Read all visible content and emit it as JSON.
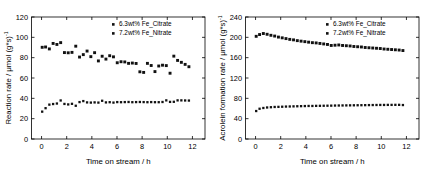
{
  "figure": {
    "background": "#ffffff",
    "axis_color": "#000000",
    "marker_color": "#111111"
  },
  "legend": {
    "position": "top-right",
    "entries": [
      {
        "marker": "square",
        "label": "6.3wt% Fe_Citrate"
      },
      {
        "marker": "square",
        "label": "7.2wt% Fe_Nitrate"
      }
    ]
  },
  "chart_data": [
    {
      "type": "scatter",
      "panel": "left",
      "title": "",
      "xlabel": "Time on stream / h",
      "ylabel_main": "Reaction rate / μmol (g*s)",
      "ylabel_sup": "-1",
      "xlim": [
        -0.8,
        13.0
      ],
      "ylim": [
        0,
        120
      ],
      "xticks": [
        0,
        2,
        4,
        6,
        8,
        10,
        12
      ],
      "yticks": [
        0,
        20,
        40,
        60,
        80,
        100,
        120
      ],
      "xtick_labels": [
        "0",
        "2",
        "4",
        "6",
        "8",
        "10",
        "12"
      ],
      "ytick_labels": [
        "0",
        "20",
        "40",
        "60",
        "80",
        "100",
        "120"
      ],
      "grid": false,
      "series": [
        {
          "name": "6.3wt% Fe_Citrate",
          "x": [
            0.05,
            0.32,
            0.62,
            0.92,
            1.22,
            1.52,
            1.82,
            2.12,
            2.42,
            2.72,
            3.02,
            3.32,
            3.62,
            3.92,
            4.22,
            4.52,
            4.82,
            5.12,
            5.42,
            5.72,
            6.02,
            6.32,
            6.62,
            6.92,
            7.22,
            7.52,
            7.82,
            8.12,
            8.42,
            8.72,
            9.02,
            9.32,
            9.62,
            9.92,
            10.22,
            10.52,
            10.82,
            11.12,
            11.42,
            11.72
          ],
          "y": [
            90.2,
            90.5,
            88.6,
            94.0,
            93.0,
            94.8,
            85.0,
            84.8,
            85.2,
            91.3,
            80.6,
            83.0,
            86.5,
            81.0,
            84.9,
            76.8,
            81.4,
            78.6,
            81.9,
            80.8,
            75.0,
            76.0,
            75.8,
            74.4,
            74.7,
            74.3,
            66.1,
            65.5,
            74.4,
            72.3,
            66.3,
            71.8,
            72.6,
            72.2,
            64.7,
            81.5,
            77.3,
            75.4,
            73.4,
            71.1
          ]
        },
        {
          "name": "7.2wt% Fe_Nitrate",
          "x": [
            0.05,
            0.32,
            0.62,
            0.92,
            1.22,
            1.52,
            1.82,
            2.12,
            2.42,
            2.72,
            3.02,
            3.32,
            3.62,
            3.92,
            4.22,
            4.52,
            4.82,
            5.12,
            5.42,
            5.72,
            6.02,
            6.32,
            6.62,
            6.92,
            7.22,
            7.52,
            7.82,
            8.12,
            8.42,
            8.72,
            9.02,
            9.32,
            9.62,
            9.92,
            10.22,
            10.52,
            10.82,
            11.12,
            11.42,
            11.72
          ],
          "y": [
            26.9,
            30.3,
            33.8,
            34.4,
            34.9,
            37.9,
            34.5,
            34.0,
            34.6,
            32.7,
            36.3,
            37.3,
            36.0,
            35.8,
            36.0,
            35.8,
            37.6,
            36.0,
            36.2,
            35.8,
            36.3,
            36.2,
            36.3,
            36.4,
            36.2,
            36.3,
            36.4,
            36.3,
            36.2,
            36.3,
            36.2,
            36.2,
            36.4,
            38.0,
            36.5,
            36.6,
            38.0,
            38.0,
            37.9,
            37.8
          ]
        }
      ]
    },
    {
      "type": "scatter",
      "panel": "right",
      "title": "",
      "xlabel": "Time on stream / h",
      "ylabel_main": "Acrolein formation rate /  μmol (g*s)",
      "ylabel_sup": "-1",
      "xlim": [
        -0.8,
        13.0
      ],
      "ylim": [
        0,
        240
      ],
      "xticks": [
        0,
        2,
        4,
        6,
        8,
        10,
        12
      ],
      "yticks": [
        0,
        40,
        80,
        120,
        160,
        200,
        240
      ],
      "xtick_labels": [
        "0",
        "2",
        "4",
        "6",
        "8",
        "10",
        "12"
      ],
      "ytick_labels": [
        "0",
        "40",
        "80",
        "120",
        "160",
        "200",
        "240"
      ],
      "grid": false,
      "series": [
        {
          "name": "6.3wt% Fe_Citrate",
          "x": [
            0.05,
            0.32,
            0.62,
            0.92,
            1.22,
            1.52,
            1.82,
            2.12,
            2.42,
            2.72,
            3.02,
            3.32,
            3.62,
            3.92,
            4.22,
            4.52,
            4.82,
            5.12,
            5.42,
            5.72,
            6.02,
            6.32,
            6.62,
            6.92,
            7.22,
            7.52,
            7.82,
            8.12,
            8.42,
            8.72,
            9.02,
            9.32,
            9.62,
            9.92,
            10.22,
            10.52,
            10.82,
            11.12,
            11.42,
            11.72
          ],
          "y": [
            202.0,
            205.5,
            207.5,
            206.0,
            204.0,
            202.5,
            200.5,
            199.0,
            197.5,
            196.0,
            195.0,
            193.5,
            192.5,
            191.5,
            190.5,
            189.5,
            189.0,
            188.0,
            187.0,
            186.0,
            184.0,
            184.5,
            185.0,
            184.0,
            183.5,
            183.0,
            182.0,
            181.5,
            181.0,
            180.0,
            179.5,
            179.0,
            178.5,
            178.0,
            177.0,
            176.5,
            176.0,
            175.5,
            175.0,
            174.0
          ]
        },
        {
          "name": "7.2wt% Fe_Nitrate",
          "x": [
            0.05,
            0.32,
            0.62,
            0.92,
            1.22,
            1.52,
            1.82,
            2.12,
            2.42,
            2.72,
            3.02,
            3.32,
            3.62,
            3.92,
            4.22,
            4.52,
            4.82,
            5.12,
            5.42,
            5.72,
            6.02,
            6.32,
            6.62,
            6.92,
            7.22,
            7.52,
            7.82,
            8.12,
            8.42,
            8.72,
            9.02,
            9.32,
            9.62,
            9.92,
            10.22,
            10.52,
            10.82,
            11.12,
            11.42,
            11.72
          ],
          "y": [
            55.0,
            59.5,
            61.0,
            62.0,
            62.5,
            63.0,
            63.2,
            63.5,
            63.8,
            64.0,
            64.2,
            64.4,
            64.6,
            64.8,
            65.0,
            65.0,
            65.2,
            65.3,
            65.4,
            65.5,
            65.6,
            65.8,
            65.9,
            66.0,
            66.1,
            66.2,
            66.3,
            66.4,
            66.5,
            66.6,
            66.7,
            66.8,
            66.9,
            67.0,
            67.0,
            67.1,
            67.1,
            67.2,
            67.2,
            66.8
          ]
        }
      ]
    }
  ]
}
